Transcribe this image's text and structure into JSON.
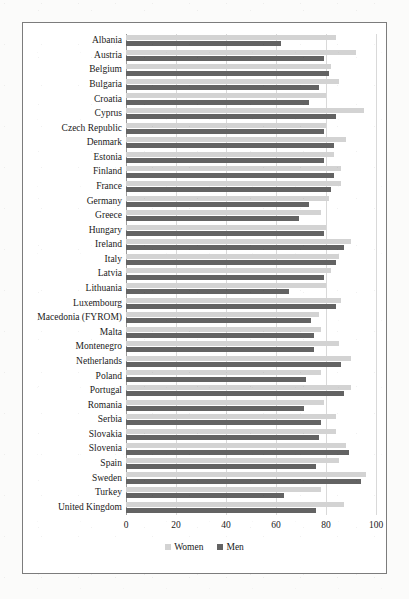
{
  "chart_data": {
    "type": "bar",
    "orientation": "horizontal",
    "title": "",
    "subtitle": "",
    "xlabel": "",
    "ylabel": "",
    "xlim": [
      0,
      100
    ],
    "xticks": [
      0,
      20,
      40,
      60,
      80,
      100
    ],
    "xtick_labels": [
      "0",
      "20",
      "40",
      "60",
      "80",
      "100"
    ],
    "grid": true,
    "legend_position": "bottom",
    "colors": {
      "women": "#d3d3d3",
      "men": "#636363",
      "gridline": "#d9d9d9",
      "axis": "#9a9a9a",
      "frame": "#7c7c7c",
      "text": "#1a1a1a",
      "background": "#ffffff"
    },
    "categories": [
      "Albania",
      "Austria",
      "Belgium",
      "Bulgaria",
      "Croatia",
      "Cyprus",
      "Czech Republic",
      "Denmark",
      "Estonia",
      "Finland",
      "France",
      "Germany",
      "Greece",
      "Hungary",
      "Ireland",
      "Italy",
      "Latvia",
      "Lithuania",
      "Luxembourg",
      "Macedonia (FYROM)",
      "Malta",
      "Montenegro",
      "Netherlands",
      "Poland",
      "Portugal",
      "Romania",
      "Serbia",
      "Slovakia",
      "Slovenia",
      "Spain",
      "Sweden",
      "Turkey",
      "United Kingdom"
    ],
    "series": [
      {
        "name": "Women",
        "color": "#d3d3d3",
        "values": [
          84,
          92,
          82,
          85,
          80,
          95,
          80,
          88,
          83,
          86,
          86,
          81,
          78,
          80,
          90,
          85,
          82,
          80,
          86,
          77,
          78,
          85,
          90,
          78,
          90,
          79,
          84,
          84,
          88,
          85,
          96,
          78,
          87
        ]
      },
      {
        "name": "Men",
        "color": "#636363",
        "values": [
          62,
          79,
          81,
          77,
          73,
          84,
          79,
          83,
          79,
          83,
          82,
          73,
          69,
          79,
          87,
          84,
          79,
          65,
          84,
          74,
          75,
          75,
          86,
          72,
          87,
          71,
          78,
          77,
          89,
          76,
          94,
          63,
          76
        ]
      }
    ],
    "legend": [
      {
        "label": "Women",
        "color": "#d3d3d3"
      },
      {
        "label": "Men",
        "color": "#636363"
      }
    ]
  }
}
